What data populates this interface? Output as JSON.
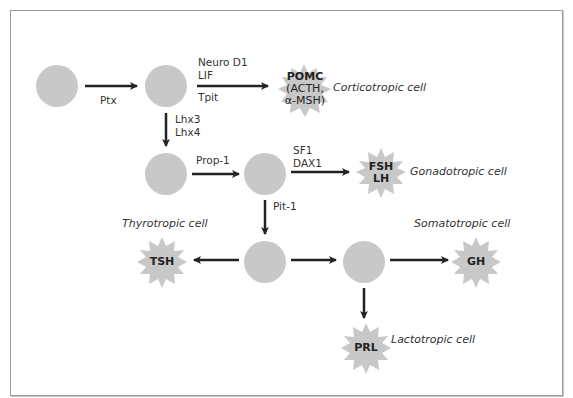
{
  "diagram": {
    "colors": {
      "node_fill": "#c8c8c8",
      "arrow": "#222222",
      "frame": "#9a9a9a",
      "text": "#333333"
    },
    "nodes": [
      {
        "id": "n1",
        "type": "progenitor-cell",
        "cx": 57,
        "cy": 86
      },
      {
        "id": "n2",
        "type": "progenitor-cell",
        "cx": 166,
        "cy": 86
      },
      {
        "id": "n3",
        "type": "progenitor-cell",
        "cx": 166,
        "cy": 174
      },
      {
        "id": "n4",
        "type": "progenitor-cell",
        "cx": 265,
        "cy": 174
      },
      {
        "id": "n5",
        "type": "progenitor-cell",
        "cx": 265,
        "cy": 262
      },
      {
        "id": "n6",
        "type": "progenitor-cell",
        "cx": 364,
        "cy": 262
      }
    ],
    "transcription_factors": {
      "ptx": "Ptx",
      "neuro_d1": "Neuro D1",
      "lif": "LIF",
      "tpit": "Tpit",
      "lhx3": "Lhx3",
      "lhx4": "Lhx4",
      "prop1": "Prop-1",
      "sf1": "SF1",
      "dax1": "DAX1",
      "pit1": "Pit-1"
    },
    "hormones": {
      "pomc": {
        "line1": "POMC",
        "line2": "(ACTH,",
        "line3": "α-MSH)"
      },
      "fsh_lh": {
        "line1": "FSH",
        "line2": "LH"
      },
      "tsh": "TSH",
      "gh": "GH",
      "prl": "PRL"
    },
    "cell_types": {
      "corticotropic": "Corticotropic cell",
      "gonadotropic": "Gonadotropic cell",
      "thyrotropic": "Thyrotropic cell",
      "somatotropic": "Somatotropic cell",
      "lactotropic": "Lactotropic cell"
    }
  }
}
